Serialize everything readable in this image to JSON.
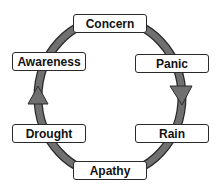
{
  "diagram": {
    "type": "cycle",
    "nodes": [
      {
        "id": "concern",
        "label": "Concern"
      },
      {
        "id": "panic",
        "label": "Panic"
      },
      {
        "id": "rain",
        "label": "Rain"
      },
      {
        "id": "apathy",
        "label": "Apathy"
      },
      {
        "id": "drought",
        "label": "Drought"
      },
      {
        "id": "awareness",
        "label": "Awareness"
      }
    ],
    "edges": [
      [
        "concern",
        "panic"
      ],
      [
        "panic",
        "rain"
      ],
      [
        "rain",
        "apathy"
      ],
      [
        "apathy",
        "drought"
      ],
      [
        "drought",
        "awareness"
      ],
      [
        "awareness",
        "concern"
      ]
    ],
    "direction": "clockwise",
    "arrow_color": "#707070"
  }
}
